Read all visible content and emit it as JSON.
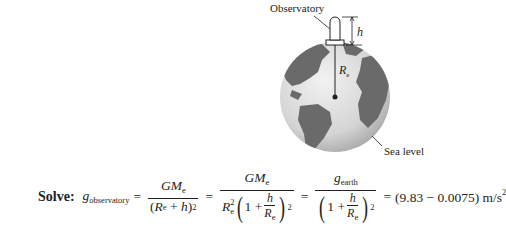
{
  "figure": {
    "labels": {
      "observatory": "Observatory",
      "height": "h",
      "radius": "R",
      "radius_sub": "e",
      "sea_level": "Sea level"
    },
    "colors": {
      "ocean": "#d9d9d9",
      "land": "#6e6e6e",
      "line": "#231f20"
    }
  },
  "equation": {
    "solve_label": "Solve:",
    "g": "g",
    "g_obs_sub": "observatory",
    "g_earth_sub": "earth",
    "GM": "GM",
    "e": "e",
    "R": "R",
    "h": "h",
    "one": "1",
    "plus": "+",
    "equals": "=",
    "sq": "2",
    "result": "(9.83 − 0.0075) m/s",
    "result_sup": "2"
  }
}
